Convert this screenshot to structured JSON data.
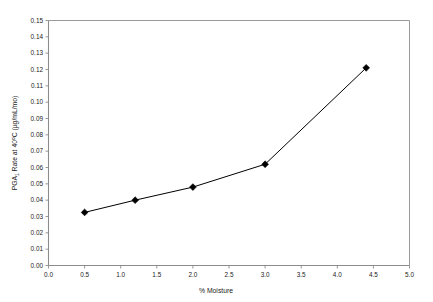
{
  "chart_data": {
    "type": "line",
    "title": "",
    "subtitle": "",
    "xlabel": "% Moisture",
    "ylabel": "PGA1 Rate at 40°C (µg/mL/mo)",
    "ylabel_parts": {
      "prefix": "PGA",
      "subscript": "1",
      "middle": " Rate at 40",
      "superscript": "o",
      "suffix": "C (µg/mL/mo)"
    },
    "xlim": [
      0.0,
      5.0
    ],
    "ylim": [
      0.0,
      0.15
    ],
    "grid": false,
    "legend": false,
    "legend_position": "none",
    "marker": "diamond",
    "line_color": "#000000",
    "marker_color": "#000000",
    "frame_color": "#9a9a9a",
    "background_color": "#ffffff",
    "x": [
      0.5,
      1.2,
      2.0,
      3.0,
      4.4
    ],
    "values": [
      0.0325,
      0.04,
      0.048,
      0.062,
      0.121
    ],
    "series": [
      {
        "name": "PGA1 degradation rate",
        "x": [
          0.5,
          1.2,
          2.0,
          3.0,
          4.4
        ],
        "values": [
          0.0325,
          0.04,
          0.048,
          0.062,
          0.121
        ]
      }
    ],
    "xticks": [
      0.0,
      0.5,
      1.0,
      1.5,
      2.0,
      2.5,
      3.0,
      3.5,
      4.0,
      4.5,
      5.0
    ],
    "xticklabels": [
      "0.0",
      "0.5",
      "1.0",
      "1.5",
      "2.0",
      "2.5",
      "3.0",
      "3.5",
      "4.0",
      "4.5",
      "5.0"
    ],
    "yticks": [
      0.0,
      0.01,
      0.02,
      0.03,
      0.04,
      0.05,
      0.06,
      0.07,
      0.08,
      0.09,
      0.1,
      0.11,
      0.12,
      0.13,
      0.14,
      0.15
    ],
    "yticklabels": [
      "0.00",
      "0.01",
      "0.02",
      "0.03",
      "0.04",
      "0.05",
      "0.06",
      "0.07",
      "0.08",
      "0.09",
      "0.10",
      "0.11",
      "0.12",
      "0.13",
      "0.14",
      "0.15"
    ]
  }
}
